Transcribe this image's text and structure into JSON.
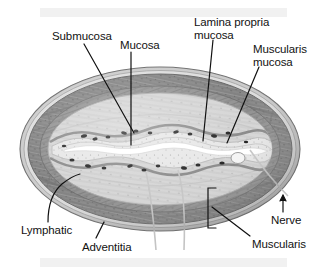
{
  "figure": {
    "type": "anatomical-cross-section",
    "orientation": "transverse oval section",
    "palette": {
      "background": "#ffffff",
      "band": "#f1f1f1",
      "outer_rim": "#8d8d8d",
      "muscularis_dark": "#7b7b7b",
      "muscularis_mid": "#9a9a9a",
      "submucosa_light": "#d9d9d9",
      "mucosa_pale": "#ededed",
      "lumen_white": "#ffffff",
      "nuclei_dark": "#1a1a1a",
      "leader_line": "#111111",
      "leader_line_light": "#c8c8c8",
      "text": "#121212"
    }
  },
  "labels": [
    {
      "id": "submucosa",
      "text": "Submucosa",
      "x": 52,
      "y": 30,
      "align": "left"
    },
    {
      "id": "mucosa",
      "text": "Mucosa",
      "x": 120,
      "y": 39,
      "align": "left"
    },
    {
      "id": "lamina-propria",
      "text": "Lamina propria\nmucosa",
      "x": 194,
      "y": 16,
      "align": "left"
    },
    {
      "id": "muscularis-mucosa",
      "text": "Muscularis\nmucosa",
      "x": 253,
      "y": 43,
      "align": "left"
    },
    {
      "id": "lymphatic",
      "text": "Lymphatic",
      "x": 21,
      "y": 224,
      "align": "left"
    },
    {
      "id": "adventitia",
      "text": "Adventitia",
      "x": 82,
      "y": 241,
      "align": "left"
    },
    {
      "id": "muscularis",
      "text": "Muscularis",
      "x": 252,
      "y": 238,
      "align": "left"
    },
    {
      "id": "nerve",
      "text": "Nerve",
      "x": 271,
      "y": 214,
      "align": "left"
    }
  ],
  "structures": [
    {
      "id": "adventitia-layer",
      "name": "Adventitia",
      "description": "outermost connective tissue rim of the oval"
    },
    {
      "id": "muscularis-externa",
      "name": "Muscularis",
      "description": "thick dark muscle ring, bracketed at lower right"
    },
    {
      "id": "submucosa-layer",
      "name": "Submucosa",
      "description": "pale loose layer inside the muscularis"
    },
    {
      "id": "muscularis-mucosae",
      "name": "Muscularis mucosa",
      "description": "thin muscle band bounding the mucosa"
    },
    {
      "id": "lamina-propria-layer",
      "name": "Lamina propria mucosa",
      "description": "connective layer beneath the epithelium"
    },
    {
      "id": "mucosa-layer",
      "name": "Mucosa",
      "description": "folded inner lining surrounding the lumen"
    },
    {
      "id": "lumen",
      "name": "Lumen",
      "description": "central white irregular slit"
    },
    {
      "id": "lymphatic-vessel",
      "name": "Lymphatic",
      "description": "vessel in the outer wall, lower left"
    },
    {
      "id": "nerve-bundle",
      "name": "Nerve",
      "description": "small bundle at the right wall, arrow-marked"
    }
  ]
}
